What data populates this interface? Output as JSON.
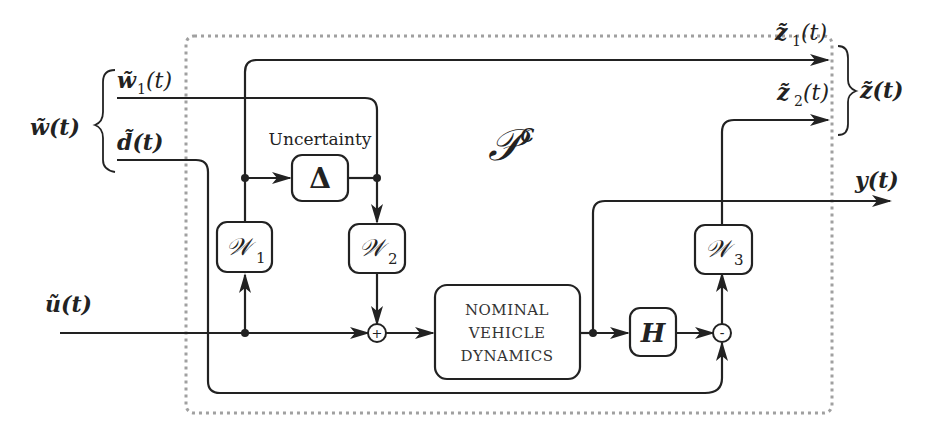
{
  "diagram": {
    "title_label": "𝒫",
    "title_superscript": "c",
    "colors": {
      "line": "#222222",
      "dotted_border": "#a0a0a0",
      "background": "#ffffff"
    },
    "inputs": {
      "w_group": "w̃(t)",
      "w1": "w̃",
      "w1_sub": "1",
      "w1_arg": "(t)",
      "d": "d̃(t)",
      "u": "ũ(t)"
    },
    "outputs": {
      "z_group": "z̃(t)",
      "z1": "z̃",
      "z1_sub": "1",
      "z1_arg": "(t)",
      "z2": "z̃",
      "z2_sub": "2",
      "z2_arg": "(t)",
      "y": "y(t)"
    },
    "blocks": {
      "uncertainty_label": "Uncertainty",
      "delta": "Δ",
      "W1": "𝒲",
      "W1_sub": "1",
      "W2": "𝒲",
      "W2_sub": "2",
      "W3": "𝒲",
      "W3_sub": "3",
      "nominal_line1": "NOMINAL",
      "nominal_line2": "VEHICLE",
      "nominal_line3": "DYNAMICS",
      "H": "H"
    },
    "junctions": {
      "sum": "+",
      "difference": "-"
    }
  }
}
